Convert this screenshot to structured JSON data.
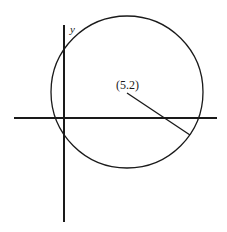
{
  "diagram": {
    "axes": {
      "y_label": "y",
      "x_label": ""
    },
    "circle": {
      "center_label": "(5.2)",
      "center_coords": [
        5,
        2
      ]
    },
    "colors": {
      "stroke": "#1a1a1a",
      "background": "#ffffff"
    }
  }
}
